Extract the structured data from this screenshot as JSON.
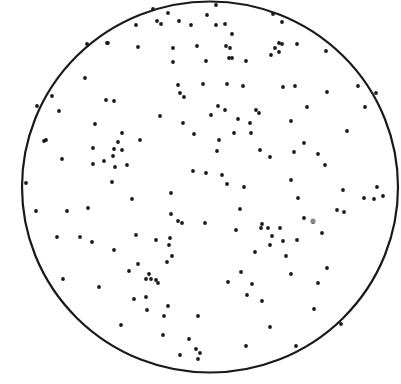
{
  "figure": {
    "background": "#ffffff",
    "ink": "#1a1a1a",
    "circle": {
      "cx": 210,
      "cy": 187,
      "rx": 188,
      "ry": 185.5,
      "stroke_width": 2.2
    },
    "dot_radius": 1.9,
    "dots": [
      [
        87,
        44
      ],
      [
        108,
        43
      ],
      [
        136,
        25
      ],
      [
        153,
        9
      ],
      [
        168,
        13
      ],
      [
        157,
        21
      ],
      [
        161,
        24
      ],
      [
        179,
        21
      ],
      [
        191,
        25
      ],
      [
        207,
        15
      ],
      [
        216,
        5
      ],
      [
        225,
        24
      ],
      [
        232,
        34
      ],
      [
        197,
        46
      ],
      [
        173,
        48
      ],
      [
        226,
        46
      ],
      [
        229,
        58
      ],
      [
        246,
        61
      ],
      [
        273,
        14
      ],
      [
        227,
        84
      ],
      [
        203,
        84
      ],
      [
        178,
        85
      ],
      [
        180,
        93
      ],
      [
        184,
        97
      ],
      [
        160,
        116
      ],
      [
        183,
        123
      ],
      [
        211,
        115
      ],
      [
        238,
        119
      ],
      [
        250,
        123
      ],
      [
        251,
        133
      ],
      [
        216,
        25
      ],
      [
        230,
        48
      ],
      [
        232,
        58
      ],
      [
        206,
        61
      ],
      [
        282,
        22
      ],
      [
        279,
        52
      ],
      [
        275,
        48
      ],
      [
        279,
        43
      ],
      [
        282,
        44
      ],
      [
        271,
        55
      ],
      [
        297,
        44
      ],
      [
        326,
        51
      ],
      [
        243,
        86
      ],
      [
        225,
        110
      ],
      [
        256,
        110
      ],
      [
        218,
        106
      ],
      [
        283,
        87
      ],
      [
        295,
        86
      ],
      [
        327,
        92
      ],
      [
        358,
        86
      ],
      [
        376,
        93
      ],
      [
        365,
        107
      ],
      [
        307,
        107
      ],
      [
        291,
        121
      ],
      [
        259,
        113
      ],
      [
        52,
        96
      ],
      [
        37,
        106
      ],
      [
        59,
        111
      ],
      [
        95,
        124
      ],
      [
        44,
        141
      ],
      [
        62,
        159
      ],
      [
        85,
        78
      ],
      [
        106,
        100
      ],
      [
        114,
        101
      ],
      [
        107,
        43
      ],
      [
        173,
        62
      ],
      [
        138,
        47
      ],
      [
        46,
        140
      ],
      [
        93,
        148
      ],
      [
        114,
        149
      ],
      [
        122,
        150
      ],
      [
        118,
        142
      ],
      [
        122,
        133
      ],
      [
        104,
        161
      ],
      [
        113,
        156
      ],
      [
        93,
        164
      ],
      [
        115,
        167
      ],
      [
        127,
        165
      ],
      [
        132,
        199
      ],
      [
        112,
        182
      ],
      [
        67,
        211
      ],
      [
        88,
        208
      ],
      [
        26,
        183
      ],
      [
        36,
        211
      ],
      [
        57,
        237
      ],
      [
        80,
        237
      ],
      [
        92,
        242
      ],
      [
        114,
        250
      ],
      [
        140,
        140
      ],
      [
        194,
        134
      ],
      [
        219,
        140
      ],
      [
        234,
        133
      ],
      [
        217,
        151
      ],
      [
        260,
        150
      ],
      [
        270,
        157
      ],
      [
        193,
        171
      ],
      [
        206,
        173
      ],
      [
        222,
        175
      ],
      [
        227,
        184
      ],
      [
        244,
        187
      ],
      [
        171,
        193
      ],
      [
        171,
        214
      ],
      [
        240,
        209
      ],
      [
        262,
        224
      ],
      [
        178,
        221
      ],
      [
        182,
        223
      ],
      [
        205,
        223
      ],
      [
        236,
        230
      ],
      [
        136,
        235
      ],
      [
        156,
        240
      ],
      [
        170,
        238
      ],
      [
        169,
        245
      ],
      [
        255,
        252
      ],
      [
        347,
        131
      ],
      [
        304,
        143
      ],
      [
        294,
        152
      ],
      [
        318,
        154
      ],
      [
        325,
        165
      ],
      [
        291,
        180
      ],
      [
        343,
        190
      ],
      [
        298,
        198
      ],
      [
        383,
        196
      ],
      [
        377,
        187
      ],
      [
        374,
        199
      ],
      [
        337,
        210
      ],
      [
        304,
        218
      ],
      [
        313,
        222
      ],
      [
        280,
        228
      ],
      [
        297,
        240
      ],
      [
        270,
        245
      ],
      [
        261,
        228
      ],
      [
        272,
        236
      ],
      [
        268,
        228
      ],
      [
        283,
        241
      ],
      [
        286,
        256
      ],
      [
        322,
        233
      ],
      [
        344,
        212
      ],
      [
        364,
        198
      ],
      [
        63,
        279
      ],
      [
        99,
        287
      ],
      [
        129,
        271
      ],
      [
        138,
        264
      ],
      [
        167,
        262
      ],
      [
        172,
        256
      ],
      [
        146,
        279
      ],
      [
        134,
        299
      ],
      [
        121,
        325
      ],
      [
        158,
        283
      ],
      [
        146,
        297
      ],
      [
        147,
        310
      ],
      [
        151,
        279
      ],
      [
        156,
        280
      ],
      [
        149,
        274
      ],
      [
        164,
        316
      ],
      [
        168,
        306
      ],
      [
        198,
        316
      ],
      [
        163,
        335
      ],
      [
        196,
        349
      ],
      [
        180,
        355
      ],
      [
        198,
        359
      ],
      [
        246,
        346
      ],
      [
        241,
        272
      ],
      [
        228,
        282
      ],
      [
        247,
        295
      ],
      [
        252,
        284
      ],
      [
        262,
        301
      ],
      [
        270,
        327
      ],
      [
        291,
        274
      ],
      [
        314,
        309
      ],
      [
        341,
        324
      ],
      [
        327,
        268
      ],
      [
        318,
        283
      ],
      [
        296,
        346
      ],
      [
        189,
        339
      ],
      [
        200,
        353
      ]
    ],
    "faint_dot": {
      "x": 313,
      "y": 221,
      "r": 2.6,
      "color": "#8a8a8a"
    }
  }
}
